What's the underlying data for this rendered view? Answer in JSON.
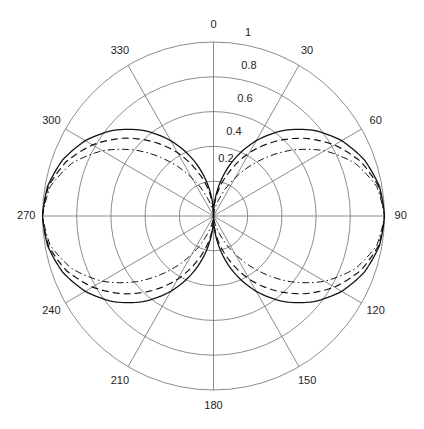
{
  "chart_data": {
    "type": "line",
    "subtype": "polar",
    "title": "",
    "angle_zero": "top",
    "angle_direction": "clockwise",
    "angle_ticks": [
      0,
      30,
      60,
      90,
      120,
      150,
      180,
      210,
      240,
      270,
      300,
      330
    ],
    "angle_tick_labels": [
      "0",
      "30",
      "60",
      "90",
      "120",
      "150",
      "180",
      "210",
      "240",
      "270",
      "300",
      "330"
    ],
    "radial_range": [
      0,
      1
    ],
    "radial_ticks": [
      0.2,
      0.4,
      0.6,
      0.8,
      1
    ],
    "radial_tick_labels": [
      "0.2",
      "0.4",
      "0.6",
      "0.8",
      "1"
    ],
    "grid": true,
    "legend": "none",
    "series": [
      {
        "name": "solid",
        "line_style": "solid",
        "color": "#111111",
        "angle_deg": [
          0,
          10,
          20,
          30,
          40,
          50,
          60,
          70,
          80,
          90,
          100,
          110,
          120,
          130,
          140,
          150,
          160,
          170,
          180,
          190,
          200,
          210,
          220,
          230,
          240,
          250,
          260,
          270,
          280,
          290,
          300,
          310,
          320,
          330,
          340,
          350,
          360
        ],
        "r": [
          0,
          0.174,
          0.342,
          0.5,
          0.643,
          0.766,
          0.866,
          0.94,
          0.985,
          1,
          0.985,
          0.94,
          0.866,
          0.766,
          0.643,
          0.5,
          0.342,
          0.174,
          0,
          0.174,
          0.342,
          0.5,
          0.643,
          0.766,
          0.866,
          0.94,
          0.985,
          1,
          0.985,
          0.94,
          0.866,
          0.766,
          0.643,
          0.5,
          0.342,
          0.174,
          0
        ]
      },
      {
        "name": "dashed",
        "line_style": "dashed",
        "color": "#111111",
        "angle_deg": [
          0,
          10,
          20,
          30,
          40,
          50,
          60,
          70,
          80,
          90,
          100,
          110,
          120,
          130,
          140,
          150,
          160,
          170,
          180,
          190,
          200,
          210,
          220,
          230,
          240,
          250,
          260,
          270,
          280,
          290,
          300,
          310,
          320,
          330,
          340,
          350,
          360
        ],
        "r": [
          0,
          0.137,
          0.27,
          0.419,
          0.559,
          0.695,
          0.817,
          0.916,
          0.98,
          1,
          0.98,
          0.916,
          0.817,
          0.695,
          0.559,
          0.419,
          0.27,
          0.137,
          0,
          0.137,
          0.27,
          0.419,
          0.559,
          0.695,
          0.817,
          0.916,
          0.98,
          1,
          0.98,
          0.916,
          0.817,
          0.695,
          0.559,
          0.419,
          0.27,
          0.137,
          0
        ]
      },
      {
        "name": "dash-dot",
        "line_style": "dash-dot",
        "color": "#111111",
        "angle_deg": [
          0,
          10,
          20,
          30,
          40,
          50,
          60,
          70,
          80,
          90,
          100,
          110,
          120,
          130,
          140,
          150,
          160,
          170,
          180,
          190,
          200,
          210,
          220,
          230,
          240,
          250,
          260,
          270,
          280,
          290,
          300,
          310,
          320,
          330,
          340,
          350,
          360
        ],
        "r": [
          0,
          0.03,
          0.117,
          0.25,
          0.413,
          0.587,
          0.75,
          0.883,
          0.97,
          1,
          0.97,
          0.883,
          0.75,
          0.587,
          0.413,
          0.25,
          0.117,
          0.03,
          0,
          0.03,
          0.117,
          0.25,
          0.413,
          0.587,
          0.75,
          0.883,
          0.97,
          1,
          0.97,
          0.883,
          0.75,
          0.587,
          0.413,
          0.25,
          0.117,
          0.03,
          0
        ]
      }
    ]
  }
}
